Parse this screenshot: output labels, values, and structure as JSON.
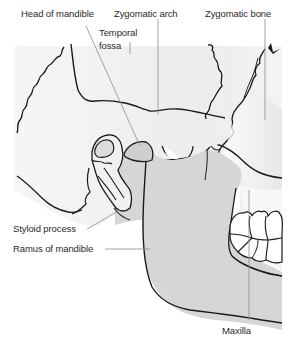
{
  "figure": {
    "colors": {
      "background": "#ffffff",
      "skull_fill": "#f1f1f1",
      "mandible_fill": "#d6d6d6",
      "outline": "#1a1a1a",
      "leader_line": "#8c8c8c",
      "label_text": "#2a2a2a"
    }
  },
  "labels": {
    "head_of_mandible": "Head of mandible",
    "zygomatic_arch": "Zygomatic arch",
    "zygomatic_bone": "Zygomatic bone",
    "temporal_fossa_line1": "Temporal",
    "temporal_fossa_line2": "fossa",
    "styloid_process": "Styloid process",
    "ramus_of_mandible": "Ramus of mandible",
    "maxilla": "Maxilla"
  }
}
